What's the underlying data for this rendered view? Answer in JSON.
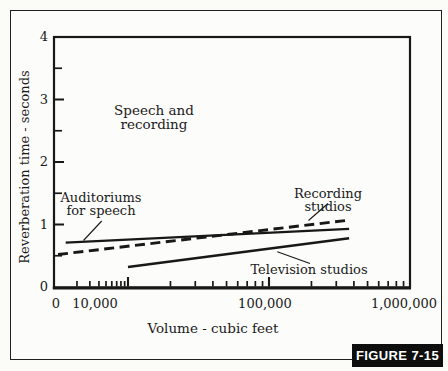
{
  "figure": {
    "badge": "FIGURE 7-15"
  },
  "chart_data": {
    "type": "line",
    "xlabel": "Volume - cubic feet",
    "ylabel": "Reverberation time - seconds",
    "x_scale": "log",
    "x_tick_labels": [
      "0",
      "10,000",
      "100,000",
      "1,000,000"
    ],
    "y_tick_labels": [
      "0",
      "1",
      "2",
      "3",
      "4"
    ],
    "ylim": [
      0,
      4
    ],
    "grid": false,
    "legend": "inline-annotations",
    "series": [
      {
        "name": "Auditoriums for speech",
        "style": "solid",
        "points": [
          {
            "volume": 1400,
            "seconds": 0.71
          },
          {
            "volume": 370000,
            "seconds": 0.93
          }
        ]
      },
      {
        "name": "Recording studios",
        "style": "dashed",
        "points": [
          {
            "volume": 1100,
            "seconds": 0.52
          },
          {
            "volume": 370000,
            "seconds": 1.07
          }
        ]
      },
      {
        "name": "Television studios",
        "style": "solid",
        "points": [
          {
            "volume": 10000,
            "seconds": 0.32
          },
          {
            "volume": 370000,
            "seconds": 0.78
          }
        ]
      }
    ],
    "annotations": {
      "region": "Speech and\nrecording",
      "auditoriums": "Auditoriums\nfor speech",
      "recording": "Recording studios",
      "television": "Television studios"
    },
    "ink_color": "#181818",
    "badge_bg": "#0e0e0e",
    "badge_fg": "#ffffff"
  }
}
